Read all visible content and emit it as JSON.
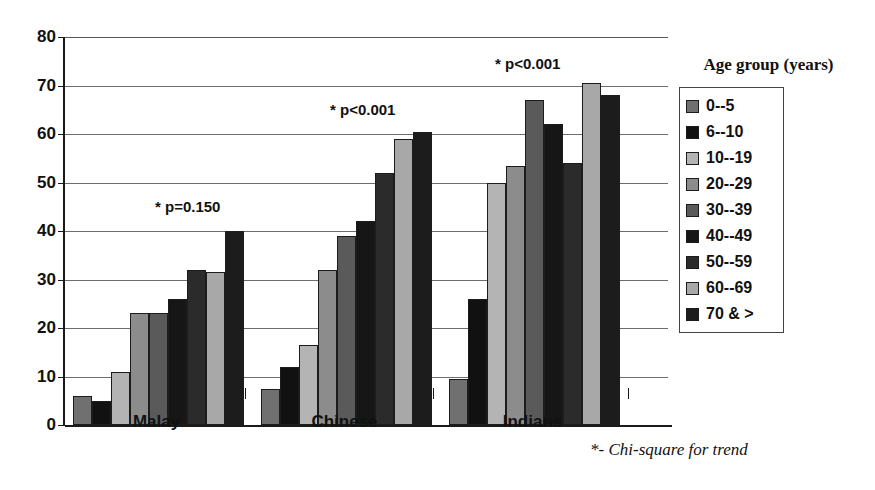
{
  "chart_data": {
    "type": "bar",
    "title": "",
    "subtitle": "",
    "xlabel": "",
    "ylabel": "",
    "ylim": [
      0,
      80
    ],
    "ytick_labels": [
      "0",
      "10",
      "20",
      "30",
      "40",
      "50",
      "60",
      "70",
      "80"
    ],
    "ytick_values": [
      0,
      10,
      20,
      30,
      40,
      50,
      60,
      70,
      80
    ],
    "grid": true,
    "legend_position": "right",
    "legend_title": "Age group (years)",
    "categories": [
      "Malay",
      "Chinese",
      "Indians"
    ],
    "series": [
      {
        "name": "0--5",
        "color": "#707070",
        "values": [
          6.0,
          7.5,
          9.5
        ]
      },
      {
        "name": "6--10",
        "color": "#111111",
        "values": [
          5.0,
          12.0,
          26.0
        ]
      },
      {
        "name": "10--19",
        "color": "#b4b4b4",
        "values": [
          11.0,
          16.5,
          50.0
        ]
      },
      {
        "name": "20--29",
        "color": "#8c8c8c",
        "values": [
          23.0,
          32.0,
          53.5
        ]
      },
      {
        "name": "30--39",
        "color": "#5a5a5a",
        "values": [
          23.0,
          39.0,
          67.0
        ]
      },
      {
        "name": "40--49",
        "color": "#161616",
        "values": [
          26.0,
          42.0,
          62.0
        ]
      },
      {
        "name": "50--59",
        "color": "#2b2b2b",
        "values": [
          32.0,
          52.0,
          54.0
        ]
      },
      {
        "name": "60--69",
        "color": "#a8a8a8",
        "values": [
          31.5,
          59.0,
          70.5
        ]
      },
      {
        "name": "70 & >",
        "color": "#1c1c1c",
        "values": [
          40.0,
          60.5,
          68.0
        ]
      }
    ],
    "annotations": [
      {
        "text": "* p=0.150",
        "category": "Malay"
      },
      {
        "text": "* p<0.001",
        "category": "Chinese"
      },
      {
        "text": "* p<0.001",
        "category": "Indians"
      }
    ],
    "footnote": "*- Chi-square for trend"
  }
}
